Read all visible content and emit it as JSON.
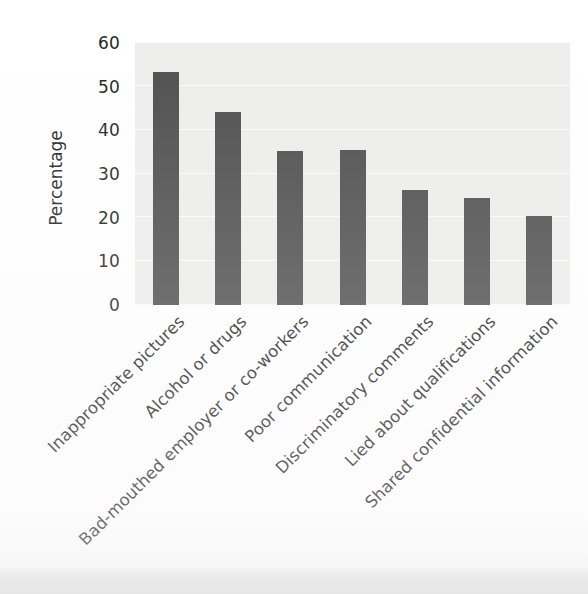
{
  "chart_data": {
    "type": "bar",
    "title": "",
    "subtitle": "",
    "xlabel": "",
    "ylabel": "Percentage",
    "ylim": [
      0,
      60
    ],
    "yticks": [
      0,
      10,
      20,
      30,
      40,
      50,
      60
    ],
    "grid": true,
    "legend": false,
    "legend_position": "none",
    "orientation": "vertical",
    "x_tick_label_rotation": -45,
    "categories": [
      "Inappropriate pictures",
      "Alcohol or drugs",
      "Bad-mouthed employer or co-workers",
      "Poor communication",
      "Discriminatory comments",
      "Lied about qualifications",
      "Shared confidential information"
    ],
    "values": [
      53.3,
      44.2,
      35.3,
      35.4,
      26.3,
      24.4,
      20.4
    ],
    "series": [
      {
        "name": "Percentage",
        "values": [
          53.3,
          44.2,
          35.3,
          35.4,
          26.3,
          24.4,
          20.4
        ]
      }
    ]
  },
  "axis": {
    "y_title": "Percentage",
    "y_tick_labels": [
      "60",
      "50",
      "40",
      "30",
      "20",
      "10",
      "0"
    ]
  },
  "style": {
    "bar_color": "#4b4b4b",
    "plot_background": "#ededec",
    "gridline_color": "#fbfbfb",
    "page_background": "#ffffff",
    "text_color": "#1d1d1d"
  }
}
